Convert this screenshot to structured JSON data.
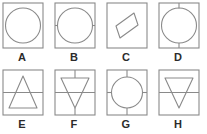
{
  "figure": {
    "stroke_color": "#8a8a8a",
    "text_color": "#2b2b2b",
    "background_color": "#ffffff",
    "rows": [
      {
        "row_index": 1,
        "panels": [
          {
            "id": "A",
            "label": "A",
            "square": true,
            "shape": "circle",
            "connectors": [],
            "divider": "none"
          },
          {
            "id": "B",
            "label": "B",
            "square": true,
            "shape": "circle",
            "connectors": [
              "left",
              "right"
            ],
            "divider": "none"
          },
          {
            "id": "C",
            "label": "C",
            "square": true,
            "shape": "rhombus",
            "connectors": [],
            "divider": "none"
          },
          {
            "id": "D",
            "label": "D",
            "square": true,
            "shape": "circle",
            "connectors": [
              "top",
              "bottom"
            ],
            "divider": "none"
          }
        ]
      },
      {
        "row_index": 2,
        "panels": [
          {
            "id": "E",
            "label": "E",
            "square": true,
            "shape": "triangle-up",
            "connectors": [],
            "divider": "horizontal"
          },
          {
            "id": "F",
            "label": "F",
            "square": true,
            "shape": "triangle-down",
            "connectors": [
              "top",
              "bottom"
            ],
            "divider": "horizontal"
          },
          {
            "id": "G",
            "label": "G",
            "square": true,
            "shape": "circle",
            "connectors": [
              "top",
              "bottom",
              "left",
              "right"
            ],
            "divider": "none"
          },
          {
            "id": "H",
            "label": "H",
            "square": true,
            "shape": "triangle-down",
            "connectors": [],
            "divider": "horizontal"
          }
        ]
      }
    ]
  }
}
